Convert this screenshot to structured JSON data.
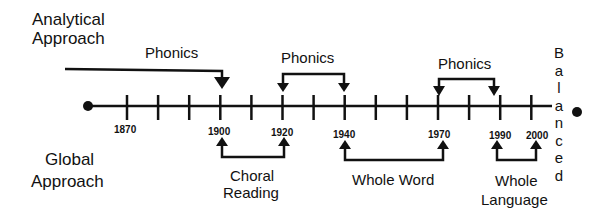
{
  "labels": {
    "analytical_line1": "Analytical",
    "analytical_line2": "Approach",
    "global_line1": "Global",
    "global_line2": "Approach",
    "balanced": [
      "B",
      "a",
      "l",
      "a",
      "n",
      "c",
      "e",
      "d"
    ]
  },
  "timeline": {
    "tick_years": [
      1860,
      1870,
      1880,
      1890,
      1900,
      1910,
      1920,
      1930,
      1940,
      1950,
      1960,
      1970,
      1980,
      1990,
      2000
    ],
    "labeled_years": [
      "1870",
      "1900",
      "1920",
      "1940",
      "1970",
      "1990",
      "2000"
    ]
  },
  "analytical_periods": [
    {
      "label": "Phonics",
      "start": "before 1870",
      "end": "1900"
    },
    {
      "label": "Phonics",
      "start": "1920",
      "end": "1940"
    },
    {
      "label": "Phonics",
      "start": "1970",
      "end": "1990"
    }
  ],
  "global_periods": [
    {
      "label_line1": "Choral",
      "label_line2": "Reading",
      "start": "1900",
      "end": "1920"
    },
    {
      "label_line1": "Whole Word",
      "label_line2": "",
      "start": "1940",
      "end": "1970"
    },
    {
      "label_line1": "Whole",
      "label_line2": "Language",
      "start": "1990",
      "end": "2000"
    }
  ]
}
